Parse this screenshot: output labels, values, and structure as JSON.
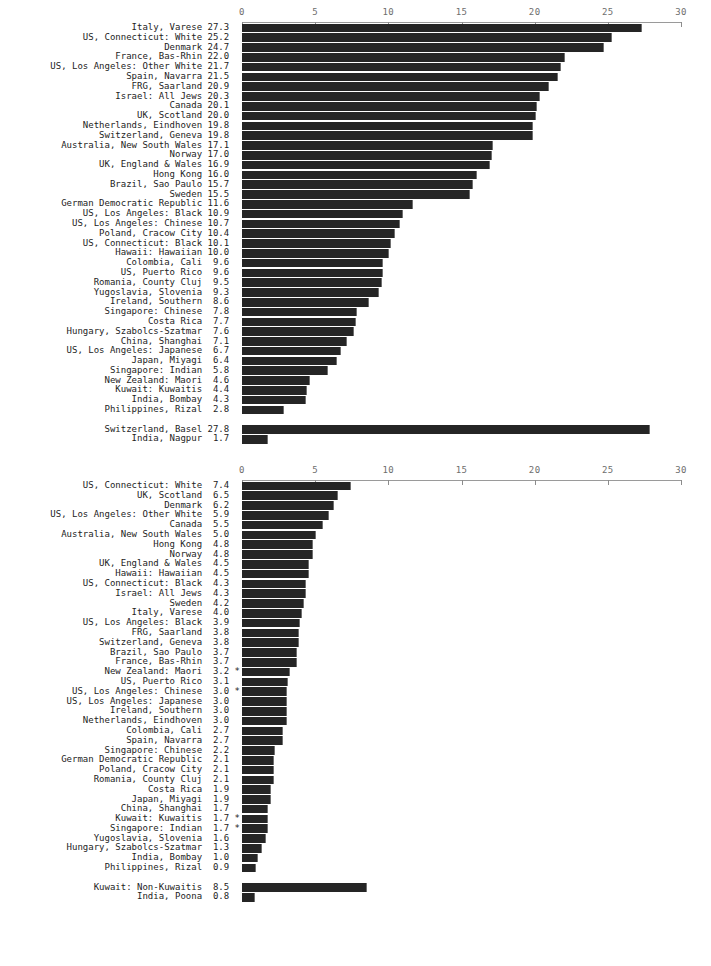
{
  "axis": {
    "ticks": [
      0,
      5,
      10,
      15,
      20,
      25,
      30
    ],
    "min": 0,
    "max": 30,
    "tick_labels": [
      "0",
      "5",
      "10",
      "15",
      "20",
      "25",
      "30"
    ]
  },
  "chart_data": [
    {
      "type": "bar",
      "orientation": "horizontal",
      "title": "",
      "xlabel": "",
      "ylabel": "",
      "xlim": [
        0,
        30
      ],
      "grid": false,
      "legend": "none",
      "tick_labels": [
        "0",
        "5",
        "10",
        "15",
        "20",
        "25",
        "30"
      ],
      "categories": [
        "Italy, Varese",
        "US, Connecticut: White",
        "Denmark",
        "France, Bas-Rhin",
        "US, Los Angeles: Other White",
        "Spain, Navarra",
        "FRG, Saarland",
        "Israel: All Jews",
        "Canada",
        "UK, Scotland",
        "Netherlands, Eindhoven",
        "Switzerland, Geneva",
        "Australia, New South Wales",
        "Norway",
        "UK, England & Wales",
        "Hong Kong",
        "Brazil, Sao Paulo",
        "Sweden",
        "German Democratic Republic",
        "US, Los Angeles: Black",
        "US, Los Angeles: Chinese",
        "Poland, Cracow City",
        "US, Connecticut: Black",
        "Hawaii: Hawaiian",
        "Colombia, Cali",
        "US, Puerto Rico",
        "Romania, County Cluj",
        "Yugoslavia, Slovenia",
        "Ireland, Southern",
        "Singapore: Chinese",
        "Costa Rica",
        "Hungary, Szabolcs-Szatmar",
        "China, Shanghai",
        "US, Los Angeles: Japanese",
        "Japan, Miyagi",
        "Singapore: Indian",
        "New Zealand: Maori",
        "Kuwait: Kuwaitis",
        "India, Bombay",
        "Philippines, Rizal",
        "Switzerland, Basel",
        "India, Nagpur"
      ],
      "values": [
        27.3,
        25.2,
        24.7,
        22.0,
        21.7,
        21.5,
        20.9,
        20.3,
        20.1,
        20.0,
        19.8,
        19.8,
        17.1,
        17.0,
        16.9,
        16.0,
        15.7,
        15.5,
        11.6,
        10.9,
        10.7,
        10.4,
        10.1,
        10.0,
        9.6,
        9.6,
        9.5,
        9.3,
        8.6,
        7.8,
        7.7,
        7.6,
        7.1,
        6.7,
        6.4,
        5.8,
        4.6,
        4.4,
        4.3,
        2.8,
        27.8,
        1.7
      ],
      "flags": [
        "",
        "",
        "",
        "",
        "",
        "",
        "",
        "",
        "",
        "",
        "",
        "",
        "",
        "",
        "",
        "",
        "",
        "",
        "",
        "",
        "",
        "",
        "",
        "",
        "",
        "",
        "",
        "",
        "",
        "",
        "",
        "",
        "",
        "",
        "",
        "",
        "",
        "",
        "",
        "",
        "",
        ""
      ],
      "group_break_after_index": 39
    },
    {
      "type": "bar",
      "orientation": "horizontal",
      "title": "",
      "xlabel": "",
      "ylabel": "",
      "xlim": [
        0,
        30
      ],
      "grid": false,
      "legend": "none",
      "tick_labels": [
        "0",
        "5",
        "10",
        "15",
        "20",
        "25",
        "30"
      ],
      "categories": [
        "US, Connecticut: White",
        "UK, Scotland",
        "Denmark",
        "US, Los Angeles: Other White",
        "Canada",
        "Australia, New South Wales",
        "Hong Kong",
        "Norway",
        "UK, England & Wales",
        "Hawaii: Hawaiian",
        "US, Connecticut: Black",
        "Israel: All Jews",
        "Sweden",
        "Italy, Varese",
        "US, Los Angeles: Black",
        "FRG, Saarland",
        "Switzerland, Geneva",
        "Brazil, Sao Paulo",
        "France, Bas-Rhin",
        "New Zealand: Maori",
        "US, Puerto Rico",
        "US, Los Angeles: Chinese",
        "US, Los Angeles: Japanese",
        "Ireland, Southern",
        "Netherlands, Eindhoven",
        "Colombia, Cali",
        "Spain, Navarra",
        "Singapore: Chinese",
        "German Democratic Republic",
        "Poland, Cracow City",
        "Romania, County Cluj",
        "Costa Rica",
        "Japan, Miyagi",
        "China, Shanghai",
        "Kuwait: Kuwaitis",
        "Singapore: Indian",
        "Yugoslavia, Slovenia",
        "Hungary, Szabolcs-Szatmar",
        "India, Bombay",
        "Philippines, Rizal",
        "Kuwait: Non-Kuwaitis",
        "India, Poona"
      ],
      "values": [
        7.4,
        6.5,
        6.2,
        5.9,
        5.5,
        5.0,
        4.8,
        4.8,
        4.5,
        4.5,
        4.3,
        4.3,
        4.2,
        4.0,
        3.9,
        3.8,
        3.8,
        3.7,
        3.7,
        3.2,
        3.1,
        3.0,
        3.0,
        3.0,
        3.0,
        2.7,
        2.7,
        2.2,
        2.1,
        2.1,
        2.1,
        1.9,
        1.9,
        1.7,
        1.7,
        1.7,
        1.6,
        1.3,
        1.0,
        0.9,
        8.5,
        0.8
      ],
      "flags": [
        "",
        "",
        "",
        "",
        "",
        "",
        "",
        "",
        "",
        "",
        "",
        "",
        "",
        "",
        "",
        "",
        "",
        "",
        "",
        "*",
        "",
        "*",
        "",
        "",
        "",
        "",
        "",
        "",
        "",
        "",
        "",
        "",
        "",
        "",
        "*",
        "*",
        "",
        "",
        "",
        "",
        "",
        ""
      ],
      "group_break_after_index": 39
    }
  ]
}
